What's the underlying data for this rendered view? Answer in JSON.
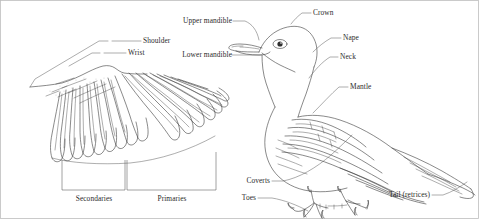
{
  "figure": {
    "border_color": "#b9b9b9",
    "ink_color": "#3a3a3a",
    "leader_color": "#4a4a4a",
    "text_color": "#2b2b2b",
    "background": "#ffffff"
  },
  "wing_panel": {
    "labels": {
      "shoulder": "Shoulder",
      "wrist": "Wrist",
      "secondaries": "Secondaries",
      "primaries": "Primaries"
    }
  },
  "bird_panel": {
    "labels": {
      "upper_mandible": "Upper mandible",
      "lower_mandible": "Lower mandible",
      "crown": "Crown",
      "nape": "Nape",
      "neck": "Neck",
      "mantle": "Mantle",
      "coverts": "Coverts",
      "toes": "Toes",
      "tail": "Tail (retrices)"
    }
  }
}
